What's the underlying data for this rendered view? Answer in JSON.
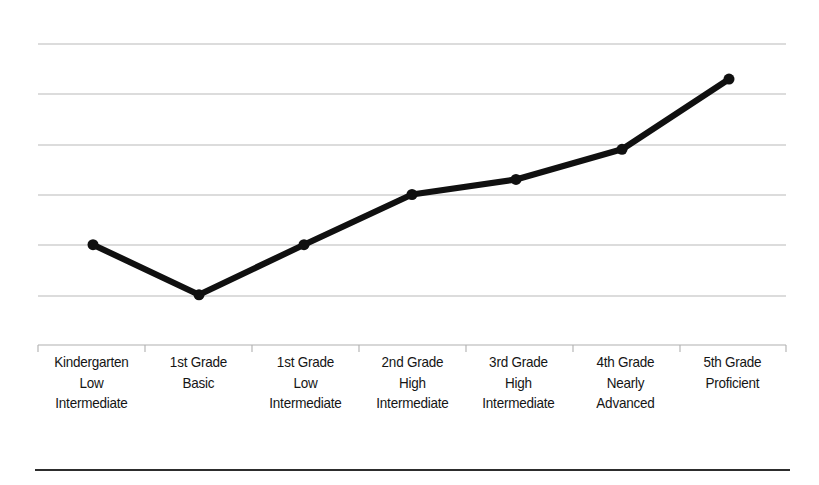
{
  "figure": {
    "name": "reading-level-progression-line-chart",
    "background_color": "#ffffff",
    "line_color": "#101010",
    "marker_color": "#101010",
    "gridline_color": "#b9b9b9",
    "axis_color": "#b0b0b0",
    "rule_color": "#2d2d2d",
    "label_color": "#151515"
  },
  "chart_data": {
    "type": "line",
    "title": "",
    "subtitle": "",
    "xlabel": "",
    "ylabel": "",
    "categories": [
      "Kindergarten Low Intermediate",
      "1st Grade Basic",
      "1st Grade Low Intermediate",
      "2nd Grade High Intermediate",
      "3rd Grade High Intermediate",
      "4th Grade Nearly Advanced",
      "5th Grade Proficient"
    ],
    "category_lines": [
      [
        "Kindergarten",
        "Low",
        "Intermediate"
      ],
      [
        "1st Grade",
        "Basic",
        ""
      ],
      [
        "1st Grade",
        "Low",
        "Intermediate"
      ],
      [
        "2nd Grade",
        "High",
        "Intermediate"
      ],
      [
        "3rd Grade",
        "High",
        "Intermediate"
      ],
      [
        "4th Grade",
        "Nearly",
        "Advanced"
      ],
      [
        "5th Grade",
        "Proficient",
        ""
      ]
    ],
    "values": [
      20,
      10,
      20,
      30,
      33,
      39,
      53
    ],
    "ylim": [
      0,
      60
    ],
    "xlim": [
      0,
      7
    ],
    "y_tick_values": [
      10,
      20,
      30,
      40,
      50,
      60
    ],
    "y_tick_labels": [
      "",
      "",
      "",
      "",
      "",
      ""
    ],
    "x_tick_labels": [
      "",
      "",
      "",
      "",
      "",
      "",
      ""
    ],
    "grid": true,
    "grid_axis": "y",
    "legend": false,
    "legend_position": "none",
    "markers": true,
    "marker_shape": "circle",
    "marker_size": 11,
    "line_width": 6,
    "series": [
      {
        "name": "Reading Level",
        "values": [
          20,
          10,
          20,
          30,
          33,
          39,
          53
        ]
      }
    ],
    "annotations": []
  },
  "geometry": {
    "plot_left": 38,
    "plot_right": 786,
    "plot_top": 44,
    "axis_y": 345,
    "gridlines_y": [
      44,
      94,
      145,
      195,
      245,
      296
    ],
    "points_px": [
      {
        "x": 93,
        "y": 245
      },
      {
        "x": 199,
        "y": 296
      },
      {
        "x": 304,
        "y": 246
      },
      {
        "x": 412,
        "y": 195
      },
      {
        "x": 516,
        "y": 180
      },
      {
        "x": 622,
        "y": 147
      },
      {
        "x": 729,
        "y": 78
      }
    ],
    "tick_x": [
      38,
      145,
      252,
      359,
      466,
      573,
      680,
      786
    ]
  }
}
